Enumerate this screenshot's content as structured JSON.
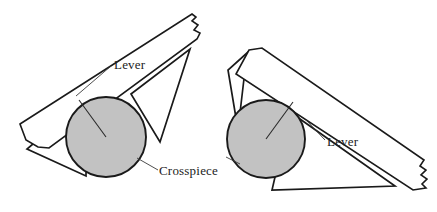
{
  "figure": {
    "background_color": "#ffffff",
    "line_color": "#1a1a1a",
    "disc_fill_color": "#c2c2c2",
    "label_color": "#222222"
  },
  "labels": {
    "lever_left": "Lever",
    "crosspiece": "Crosspiece",
    "lever_right": "Lever"
  },
  "assemblies": [
    {
      "name": "left-assembly",
      "lever_label": "Lever",
      "crosspiece_label": "Crosspiece",
      "disc": {
        "cx": 106,
        "cy": 137,
        "r": 40
      }
    },
    {
      "name": "right-assembly",
      "lever_label": "Lever",
      "disc": {
        "cx": 266,
        "cy": 139,
        "r": 39
      }
    }
  ]
}
